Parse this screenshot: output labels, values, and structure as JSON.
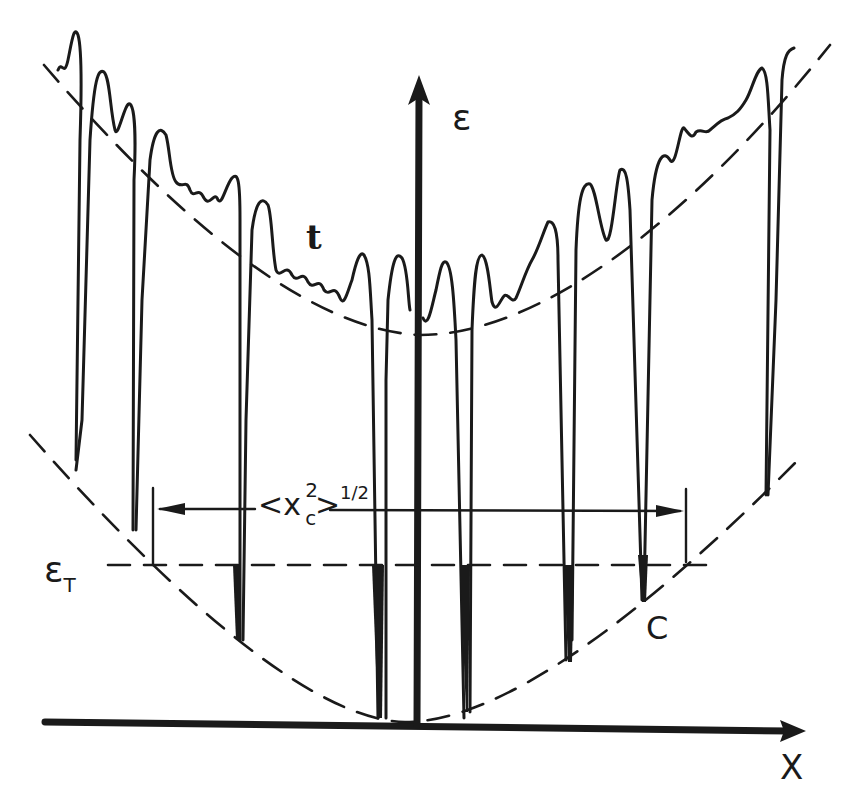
{
  "figure": {
    "type": "physics schematic",
    "axes": {
      "y_label": "ε",
      "x_label": "X"
    },
    "labels": {
      "trap_band": "t",
      "threshold": {
        "symbol": "ε",
        "subscript": "T"
      },
      "critical_point": "C",
      "width_measure": {
        "open": "<",
        "var": "x",
        "var_sup": "2",
        "var_sub": "c",
        "close": ">",
        "power": "1/2"
      }
    },
    "colors": {
      "ink": "#1a1a1a",
      "background": "#ffffff"
    }
  }
}
